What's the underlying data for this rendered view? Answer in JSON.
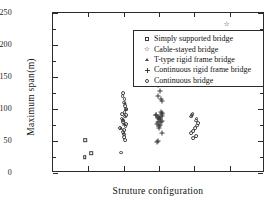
{
  "chart_data": {
    "type": "scatter",
    "title": "",
    "xlabel": "Struture configuration",
    "ylabel": "Maximum span(m)",
    "ylim": [
      0,
      250
    ],
    "ytick_labels": [
      "0",
      "50",
      "100",
      "150",
      "200",
      "250"
    ],
    "ytick_values": [
      0,
      50,
      100,
      150,
      200,
      250
    ],
    "yminor_step": 25,
    "xlim": [
      0,
      6
    ],
    "xtick_labels": [
      "",
      "",
      "",
      "",
      ""
    ],
    "xtick_values": [
      1,
      2,
      3,
      4,
      5
    ],
    "grid": false,
    "legend_position": "upper-center",
    "legend_entries": [
      "Simply supported bridge",
      "Cable-stayed bridge",
      "T-type rigid frame bridge",
      "Continuous rigid frame bridge",
      "Continuous bridge"
    ],
    "series": [
      {
        "name": "Simply supported bridge",
        "marker": "square",
        "x": [
          1,
          1,
          1
        ],
        "values": [
          25,
          31,
          51
        ]
      },
      {
        "name": "Cable-stayed bridge",
        "marker": "star",
        "x": [
          5,
          5,
          5
        ],
        "values": [
          168,
          178,
          233
        ]
      },
      {
        "name": "T-type rigid frame bridge",
        "marker": "triangle",
        "x": [
          2,
          2,
          2,
          2,
          2,
          2
        ],
        "values": [
          62,
          70,
          76,
          85,
          100,
          110
        ]
      },
      {
        "name": "Continuous rigid frame bridge",
        "marker": "plus",
        "x": [
          3,
          3,
          3,
          3,
          3,
          3,
          3,
          3,
          3,
          3,
          3,
          3,
          3,
          3,
          3,
          3,
          3,
          3,
          3,
          3,
          3,
          3,
          3,
          3,
          3,
          3
        ],
        "values": [
          48,
          50,
          62,
          70,
          73,
          75,
          77,
          79,
          80,
          82,
          84,
          85,
          86,
          87,
          88,
          89,
          90,
          91,
          92,
          94,
          96,
          112,
          116,
          120,
          128,
          137
        ]
      },
      {
        "name": "Continuous bridge",
        "marker": "circle",
        "x": [
          2,
          2,
          2,
          2,
          2,
          2,
          2,
          2,
          2,
          2,
          2,
          2,
          2,
          2,
          2,
          2,
          2,
          2,
          2,
          2,
          2,
          2,
          4,
          4,
          4,
          4,
          4,
          4,
          4,
          4,
          4,
          4,
          4,
          4
        ],
        "values": [
          32,
          52,
          56,
          60,
          64,
          67,
          70,
          73,
          76,
          79,
          82,
          85,
          88,
          90,
          92,
          95,
          100,
          105,
          110,
          115,
          120,
          125,
          55,
          58,
          62,
          66,
          70,
          74,
          78,
          82,
          85,
          88,
          90,
          92
        ]
      }
    ]
  },
  "axes": {
    "y_title": "Maximum span(m)",
    "x_title": "Struture configuration"
  },
  "legend": {
    "items": [
      {
        "label": "Simply supported bridge",
        "marker": "square"
      },
      {
        "label": "Cable-stayed bridge",
        "marker": "star"
      },
      {
        "label": "T-type rigid frame bridge",
        "marker": "triangle"
      },
      {
        "label": "Continuous rigid frame bridge",
        "marker": "plus"
      },
      {
        "label": "Continuous bridge",
        "marker": "circle"
      }
    ]
  },
  "colors": {
    "frame": "#2b2b2b",
    "marker": "#3a3a3a",
    "text": "#111111",
    "background": "#ffffff"
  }
}
